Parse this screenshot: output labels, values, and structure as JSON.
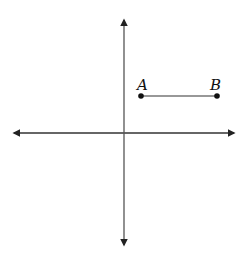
{
  "diagram": {
    "type": "coordinate-plane-segment",
    "axes": {
      "x_axis": {
        "from": [
          14,
          133
        ],
        "to": [
          234,
          133
        ],
        "arrows": "both"
      },
      "y_axis": {
        "from": [
          124,
          20
        ],
        "to": [
          124,
          245
        ],
        "arrows": "both"
      },
      "color": "#222222"
    },
    "points": [
      {
        "label": "A",
        "x": 141,
        "y": 96
      },
      {
        "label": "B",
        "x": 217,
        "y": 96
      }
    ],
    "segment": {
      "from": "A",
      "to": "B"
    }
  }
}
